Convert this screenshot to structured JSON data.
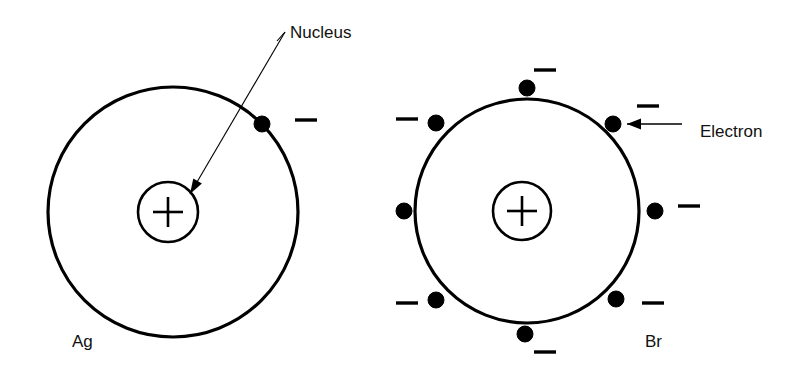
{
  "figure": {
    "background_color": "#ffffff",
    "ink_color": "#000000",
    "width": 803,
    "height": 377
  },
  "callouts": [
    {
      "id": "nucleus",
      "label": "Nucleus",
      "label_x": 290,
      "label_y": 38,
      "points_to": "ag-nucleus",
      "arrow_style": "angled-leader"
    },
    {
      "id": "electron",
      "label": "Electron",
      "label_x": 700,
      "label_y": 137,
      "points_to": "br-electron-ne",
      "arrow_style": "horizontal-arrow"
    }
  ],
  "atoms": [
    {
      "id": "ag",
      "symbol": "Ag",
      "name_label": "Ag",
      "label_x": 72,
      "label_y": 347,
      "shell": {
        "cx": 173,
        "cy": 212,
        "r": 125,
        "fill": "hatched",
        "hatch_angle_deg": 45
      },
      "nucleus": {
        "cx": 168,
        "cy": 212,
        "r": 30,
        "charge": "+"
      },
      "electron_count": 1,
      "electrons": [
        {
          "id": "ag-electron-ne",
          "angle_deg": -45,
          "cx": 262,
          "cy": 124,
          "r": 8,
          "charge": "−",
          "minus_x": 295,
          "minus_y": 120,
          "minus_len": 22
        }
      ]
    },
    {
      "id": "br",
      "symbol": "Br",
      "name_label": "Br",
      "label_x": 645,
      "label_y": 347,
      "shell": {
        "cx": 527,
        "cy": 211,
        "r": 112,
        "fill": "hatched",
        "hatch_angle_deg": 45
      },
      "nucleus": {
        "cx": 522,
        "cy": 211,
        "r": 29,
        "charge": "+"
      },
      "electron_count": 8,
      "electrons": [
        {
          "id": "br-electron-n",
          "angle_deg": -90,
          "cx": 527,
          "cy": 88,
          "r": 8,
          "charge": "−",
          "minus_x": 534,
          "minus_y": 70,
          "minus_len": 22
        },
        {
          "id": "br-electron-ne",
          "angle_deg": -45,
          "cx": 613,
          "cy": 124,
          "r": 8,
          "charge": "−",
          "minus_x": 637,
          "minus_y": 106,
          "minus_len": 22
        },
        {
          "id": "br-electron-e",
          "angle_deg": 0,
          "cx": 655,
          "cy": 211,
          "r": 8,
          "charge": "−",
          "minus_x": 678,
          "minus_y": 206,
          "minus_len": 22
        },
        {
          "id": "br-electron-se",
          "angle_deg": 45,
          "cx": 616,
          "cy": 299,
          "r": 8,
          "charge": "−",
          "minus_x": 642,
          "minus_y": 303,
          "minus_len": 22
        },
        {
          "id": "br-electron-s",
          "angle_deg": 90,
          "cx": 525,
          "cy": 334,
          "r": 8,
          "charge": "−",
          "minus_x": 534,
          "minus_y": 352,
          "minus_len": 22
        },
        {
          "id": "br-electron-sw",
          "angle_deg": 135,
          "cx": 436,
          "cy": 300,
          "r": 8,
          "charge": "−",
          "minus_x": 396,
          "minus_y": 303,
          "minus_len": 22
        },
        {
          "id": "br-electron-w",
          "angle_deg": 180,
          "cx": 404,
          "cy": 211,
          "r": 8,
          "charge": "",
          "minus_x": null,
          "minus_y": null,
          "minus_len": 0
        },
        {
          "id": "br-electron-nw",
          "angle_deg": -135,
          "cx": 436,
          "cy": 123,
          "r": 8,
          "charge": "−",
          "minus_x": 396,
          "minus_y": 119,
          "minus_len": 22
        }
      ]
    }
  ]
}
